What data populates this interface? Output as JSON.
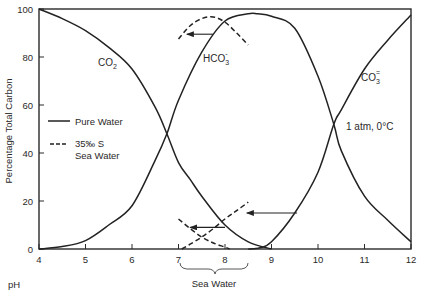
{
  "labels": {
    "co2": {
      "base": "CO",
      "sub": "2"
    },
    "hco3": {
      "base": "HCO",
      "sub": "3",
      "sup": "-"
    },
    "co3": {
      "base": "CO",
      "sub": "3",
      "sup": "="
    },
    "conditions": "1 atm, 0°C",
    "sea_water_range": "Sea Water"
  },
  "legend": {
    "pure_water": "Pure Water",
    "sea_water_line1": "35‰ S",
    "sea_water_line2": "Sea Water"
  },
  "chart_data": {
    "type": "line",
    "title": "",
    "xlabel": "pH",
    "ylabel": "Percentage Total Carbon",
    "xlim": [
      4,
      12
    ],
    "ylim": [
      0,
      100
    ],
    "xticks": [
      4,
      5,
      6,
      7,
      8,
      9,
      10,
      11,
      12
    ],
    "yticks": [
      0,
      20,
      40,
      60,
      80,
      100
    ],
    "grid": false,
    "legend_position": "left-middle inside",
    "series": [
      {
        "name": "CO2 (Pure Water)",
        "style": "solid",
        "x": [
          4,
          4.5,
          5,
          5.5,
          6,
          6.5,
          6.75,
          7,
          7.25,
          7.5,
          8,
          8.5,
          9
        ],
        "values": [
          100,
          96,
          91,
          84,
          75,
          59,
          48,
          36,
          29,
          22,
          10,
          3,
          0
        ]
      },
      {
        "name": "HCO3- (Pure Water)",
        "style": "solid",
        "x": [
          4,
          4.5,
          5,
          5.5,
          6,
          6.5,
          6.75,
          7,
          7.5,
          8,
          8.5,
          8.7,
          9,
          9.5,
          10,
          10.34,
          10.5,
          11,
          11.5,
          12
        ],
        "values": [
          0,
          1,
          3.5,
          10,
          18,
          37,
          48,
          62,
          82,
          95,
          98,
          98,
          97,
          92,
          72,
          52,
          41,
          22,
          12,
          3
        ]
      },
      {
        "name": "CO3= (Pure Water)",
        "style": "solid",
        "x": [
          8.5,
          8.75,
          9,
          9.5,
          10,
          10.34,
          10.5,
          11,
          11.5,
          12
        ],
        "values": [
          0,
          0.5,
          3,
          15,
          32,
          52,
          58,
          75,
          87,
          97.5
        ]
      },
      {
        "name": "HCO3- (35‰ S Sea Water)",
        "style": "dashed",
        "x": [
          7,
          7.25,
          7.5,
          7.75,
          8,
          8.25,
          8.5
        ],
        "values": [
          87.5,
          93,
          96,
          96.7,
          94.5,
          90,
          85
        ]
      },
      {
        "name": "CO2 (35‰ S Sea Water)",
        "style": "dashed",
        "x": [
          7,
          7.25,
          7.5,
          7.75,
          8,
          8.1
        ],
        "values": [
          12.5,
          8.5,
          5,
          2.5,
          0.8,
          0
        ]
      },
      {
        "name": "CO3= (35‰ S Sea Water)",
        "style": "dashed",
        "x": [
          7.07,
          7.25,
          7.5,
          7.75,
          8,
          8.25,
          8.5
        ],
        "values": [
          0,
          2,
          5,
          8.5,
          12.5,
          16,
          19.5
        ]
      }
    ],
    "annotations": [
      {
        "type": "arrow",
        "from": [
          7.74,
          89.5
        ],
        "to": [
          7.18,
          89.5
        ],
        "note": "HCO3- shift pure → sea water"
      },
      {
        "type": "arrow",
        "from": [
          9.55,
          15
        ],
        "to": [
          8.47,
          15
        ],
        "note": "CO3= shift pure → sea water"
      },
      {
        "type": "arrow",
        "from": [
          8.0,
          9
        ],
        "to": [
          7.25,
          9
        ],
        "note": "CO2 shift pure → sea water"
      },
      {
        "type": "bracket",
        "x_range": [
          7,
          8.5
        ],
        "text": "Sea Water"
      },
      {
        "type": "text",
        "at": [
          10.55,
          49
        ],
        "text": "1 atm, 0°C"
      }
    ]
  }
}
